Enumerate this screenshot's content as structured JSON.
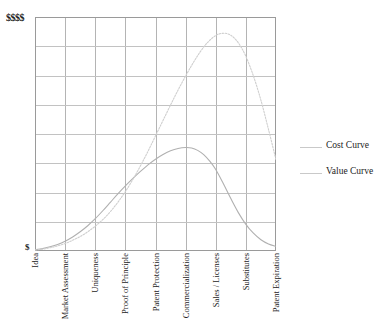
{
  "chart_data": {
    "type": "line",
    "title": "",
    "xlabel": "",
    "ylabel": "",
    "grid": true,
    "grid_columns": 8,
    "grid_rows": 8,
    "ylim": [
      0,
      1
    ],
    "y_axis_top_label": "$$$$",
    "y_axis_bottom_label": "$",
    "categories": [
      "Idea",
      "Market Assessment",
      "Uniqueness",
      "Proof of Principle",
      "Patent Protection",
      "Commercialization",
      "Sales / Licenses",
      "Substitutes",
      "Patent Expiration"
    ],
    "legend_position": "right",
    "series": [
      {
        "name": "Cost Curve",
        "color": "#b0b0b0",
        "style": "solid",
        "peak_category": "Commercialization",
        "peak_value": 0.44,
        "x": [
          0.0,
          0.25,
          0.5,
          0.75,
          1.0,
          1.25,
          1.5,
          1.75,
          2.0,
          2.25,
          2.5,
          2.75,
          3.0,
          3.25,
          3.5,
          3.75,
          4.0,
          4.25,
          4.5,
          4.75,
          5.0,
          5.2,
          5.4,
          5.6,
          5.8,
          6.0,
          6.25,
          6.5,
          6.75,
          7.0,
          7.25,
          7.5,
          7.75,
          8.0
        ],
        "values": [
          0.005,
          0.01,
          0.018,
          0.028,
          0.042,
          0.06,
          0.082,
          0.108,
          0.138,
          0.172,
          0.208,
          0.244,
          0.278,
          0.31,
          0.34,
          0.368,
          0.392,
          0.412,
          0.428,
          0.438,
          0.442,
          0.44,
          0.43,
          0.412,
          0.384,
          0.348,
          0.288,
          0.224,
          0.164,
          0.114,
          0.076,
          0.048,
          0.03,
          0.02
        ]
      },
      {
        "name": "Value Curve",
        "color": "#cfcfcf",
        "style": "dotted",
        "peak_category": "Sales / Licenses",
        "peak_value": 0.93,
        "x": [
          0.0,
          0.25,
          0.5,
          0.75,
          1.0,
          1.25,
          1.5,
          1.75,
          2.0,
          2.25,
          2.5,
          2.75,
          3.0,
          3.25,
          3.5,
          3.75,
          4.0,
          4.25,
          4.5,
          4.75,
          5.0,
          5.25,
          5.5,
          5.75,
          6.0,
          6.2,
          6.4,
          6.6,
          6.8,
          7.0,
          7.25,
          7.5,
          7.75,
          8.0
        ],
        "values": [
          0.004,
          0.008,
          0.014,
          0.022,
          0.032,
          0.046,
          0.062,
          0.082,
          0.106,
          0.134,
          0.168,
          0.208,
          0.254,
          0.306,
          0.364,
          0.426,
          0.492,
          0.558,
          0.624,
          0.688,
          0.748,
          0.804,
          0.854,
          0.894,
          0.921,
          0.93,
          0.928,
          0.912,
          0.88,
          0.832,
          0.748,
          0.644,
          0.52,
          0.39
        ]
      }
    ]
  },
  "legend": {
    "items": [
      {
        "label": "Cost Curve"
      },
      {
        "label": "Value Curve"
      }
    ]
  }
}
